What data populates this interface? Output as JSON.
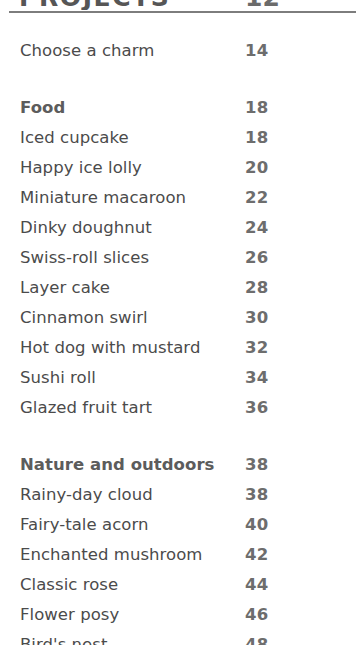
{
  "document": {
    "title": "PROJECTS",
    "title_page": "12",
    "rule_color": "#7d7d7d",
    "body_color": "#4b4b4b",
    "number_color": "#6d6d6d",
    "section_color": "#5c5c5c",
    "background": "#ffffff"
  },
  "contents": {
    "groups": [
      {
        "name": "intro",
        "rows": [
          {
            "label": "Choose a charm",
            "page": "14",
            "is_section": false
          }
        ]
      },
      {
        "name": "food",
        "rows": [
          {
            "label": "Food",
            "page": "18",
            "is_section": true
          },
          {
            "label": "Iced cupcake",
            "page": "18",
            "is_section": false
          },
          {
            "label": "Happy ice lolly",
            "page": "20",
            "is_section": false
          },
          {
            "label": "Miniature macaroon",
            "page": "22",
            "is_section": false
          },
          {
            "label": "Dinky doughnut",
            "page": "24",
            "is_section": false
          },
          {
            "label": "Swiss-roll slices",
            "page": "26",
            "is_section": false
          },
          {
            "label": "Layer cake",
            "page": "28",
            "is_section": false
          },
          {
            "label": "Cinnamon swirl",
            "page": "30",
            "is_section": false
          },
          {
            "label": "Hot dog with mustard",
            "page": "32",
            "is_section": false
          },
          {
            "label": "Sushi roll",
            "page": "34",
            "is_section": false
          },
          {
            "label": "Glazed fruit tart",
            "page": "36",
            "is_section": false
          }
        ]
      },
      {
        "name": "nature-and-outdoors",
        "rows": [
          {
            "label": "Nature and outdoors",
            "page": "38",
            "is_section": true
          },
          {
            "label": "Rainy-day cloud",
            "page": "38",
            "is_section": false
          },
          {
            "label": "Fairy-tale acorn",
            "page": "40",
            "is_section": false
          },
          {
            "label": "Enchanted mushroom",
            "page": "42",
            "is_section": false
          },
          {
            "label": "Classic rose",
            "page": "44",
            "is_section": false
          },
          {
            "label": "Flower posy",
            "page": "46",
            "is_section": false
          },
          {
            "label": "Bird's nest",
            "page": "48",
            "is_section": false
          }
        ]
      }
    ]
  }
}
